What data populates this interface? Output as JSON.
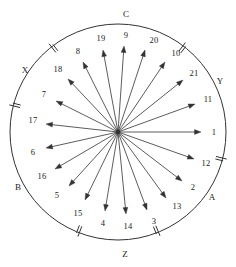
{
  "figure": {
    "name": "radial-vector-diagram",
    "center": {
      "x": 118,
      "y": 132
    },
    "radius": 108,
    "stroke_color": "#333333",
    "label_color": "#1a1a1a",
    "background_color": "#ffffff"
  },
  "chart_data": {
    "type": "scatter",
    "title": "",
    "xlabel": "",
    "ylabel": "",
    "legend": "none",
    "grid": false,
    "categories": [
      "1",
      "2",
      "3",
      "4",
      "5",
      "6",
      "7",
      "8",
      "9",
      "10",
      "11",
      "12",
      "13",
      "14",
      "15",
      "16",
      "17",
      "18",
      "19",
      "20",
      "21"
    ],
    "series": [
      {
        "name": "radial-arrows",
        "values": [
          0,
          17,
          34,
          51,
          69,
          86,
          103,
          120,
          86,
          51,
          17,
          343,
          326,
          309,
          291,
          274,
          257,
          240,
          103,
          69,
          34
        ]
      }
    ],
    "arrows": [
      {
        "label": "1",
        "angle_deg": 0,
        "tip_x": 201,
        "tip_y": 132,
        "label_x": 214,
        "label_y": 132
      },
      {
        "label": "11",
        "angle_deg": 17,
        "tip_x": 195,
        "tip_y": 104,
        "label_x": 208,
        "label_y": 99
      },
      {
        "label": "21",
        "angle_deg": 34,
        "tip_x": 183,
        "tip_y": 80,
        "label_x": 194,
        "label_y": 73
      },
      {
        "label": "10",
        "angle_deg": 51,
        "tip_x": 165,
        "tip_y": 62,
        "label_x": 176,
        "label_y": 53
      },
      {
        "label": "20",
        "angle_deg": 69,
        "tip_x": 145,
        "tip_y": 50,
        "label_x": 154,
        "label_y": 40
      },
      {
        "label": "9",
        "angle_deg": 86,
        "tip_x": 124,
        "tip_y": 46,
        "label_x": 126,
        "label_y": 35
      },
      {
        "label": "19",
        "angle_deg": 103,
        "tip_x": 103,
        "tip_y": 50,
        "label_x": 101,
        "label_y": 38
      },
      {
        "label": "8",
        "angle_deg": 120,
        "tip_x": 83,
        "tip_y": 62,
        "label_x": 78,
        "label_y": 51
      },
      {
        "label": "18",
        "angle_deg": 137,
        "tip_x": 68,
        "tip_y": 79,
        "label_x": 58,
        "label_y": 69
      },
      {
        "label": "7",
        "angle_deg": 154,
        "tip_x": 56,
        "tip_y": 101,
        "label_x": 44,
        "label_y": 94
      },
      {
        "label": "17",
        "angle_deg": 171,
        "tip_x": 46,
        "tip_y": 124,
        "label_x": 33,
        "label_y": 120
      },
      {
        "label": "6",
        "angle_deg": 188,
        "tip_x": 46,
        "tip_y": 148,
        "label_x": 33,
        "label_y": 152
      },
      {
        "label": "16",
        "angle_deg": 205,
        "tip_x": 55,
        "tip_y": 169,
        "label_x": 42,
        "label_y": 176
      },
      {
        "label": "5",
        "angle_deg": 222,
        "tip_x": 69,
        "tip_y": 186,
        "label_x": 57,
        "label_y": 195
      },
      {
        "label": "15",
        "angle_deg": 240,
        "tip_x": 85,
        "tip_y": 200,
        "label_x": 78,
        "label_y": 213
      },
      {
        "label": "4",
        "angle_deg": 257,
        "tip_x": 105,
        "tip_y": 211,
        "label_x": 103,
        "label_y": 223
      },
      {
        "label": "14",
        "angle_deg": 274,
        "tip_x": 126,
        "tip_y": 214,
        "label_x": 128,
        "label_y": 226
      },
      {
        "label": "3",
        "angle_deg": 291,
        "tip_x": 147,
        "tip_y": 210,
        "label_x": 154,
        "label_y": 221
      },
      {
        "label": "13",
        "angle_deg": 309,
        "tip_x": 166,
        "tip_y": 198,
        "label_x": 177,
        "label_y": 206
      },
      {
        "label": "2",
        "angle_deg": 326,
        "tip_x": 182,
        "tip_y": 181,
        "label_x": 193,
        "label_y": 187
      },
      {
        "label": "12",
        "angle_deg": 343,
        "tip_x": 194,
        "tip_y": 159,
        "label_x": 206,
        "label_y": 163
      }
    ],
    "sector_labels": [
      {
        "label": "C",
        "x": 126,
        "y": 14,
        "position": "top"
      },
      {
        "label": "Y",
        "x": 220,
        "y": 81,
        "position": "upper-right"
      },
      {
        "label": "A",
        "x": 212,
        "y": 197,
        "position": "lower-right"
      },
      {
        "label": "Z",
        "x": 125,
        "y": 254,
        "position": "bottom"
      },
      {
        "label": "B",
        "x": 18,
        "y": 187,
        "position": "lower-left"
      },
      {
        "label": "X",
        "x": 25,
        "y": 70,
        "position": "upper-left"
      }
    ],
    "tick_marks": [
      {
        "name": "tick-upper-left",
        "angle_deg": 128
      },
      {
        "name": "tick-left",
        "angle_deg": 166
      },
      {
        "name": "tick-lower-left",
        "angle_deg": 249
      },
      {
        "name": "tick-lower-right",
        "angle_deg": 292
      },
      {
        "name": "tick-right",
        "angle_deg": 346
      },
      {
        "name": "tick-upper-right",
        "angle_deg": 53
      }
    ]
  }
}
